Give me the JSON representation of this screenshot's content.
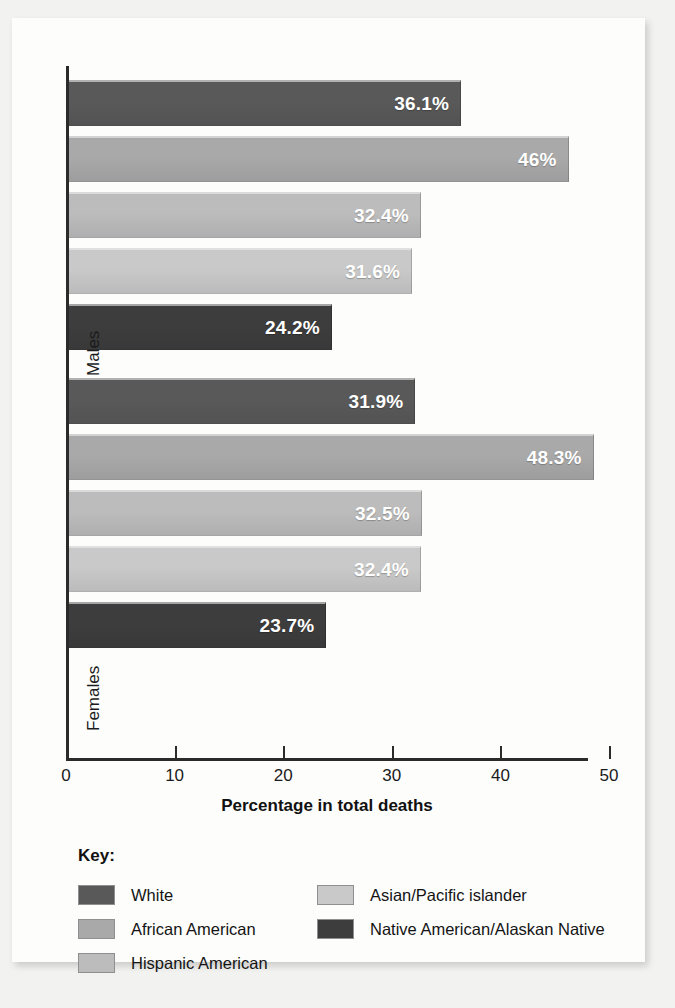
{
  "chart_data": {
    "type": "bar",
    "orientation": "horizontal",
    "title": "",
    "xlabel": "Percentage in total deaths",
    "ylabel": "",
    "xlim": [
      0,
      50
    ],
    "xticks": [
      0,
      10,
      20,
      30,
      40,
      50
    ],
    "xtick_labels": [
      "0",
      "10",
      "20",
      "30",
      "40",
      "50"
    ],
    "grid": false,
    "legend_position": "bottom",
    "legend_title": "Key:",
    "categories": [
      "White",
      "African American",
      "Hispanic American",
      "Asian/Pacific islander",
      "Native American/Alaskan Native"
    ],
    "groups": [
      "Males",
      "Females"
    ],
    "series": [
      {
        "name": "Males",
        "values": [
          36.1,
          46,
          32.4,
          31.6,
          24.2
        ],
        "labels": [
          "36.1%",
          "46%",
          "32.4%",
          "31.6%",
          "24.2%"
        ]
      },
      {
        "name": "Females",
        "values": [
          31.9,
          48.3,
          32.5,
          32.4,
          23.7
        ],
        "labels": [
          "31.9%",
          "48.3%",
          "32.5%",
          "32.4%",
          "23.7%"
        ]
      }
    ],
    "colors": {
      "White": "#595959",
      "African American": "#a9a9a9",
      "Hispanic American": "#bcbcbc",
      "Asian/Pacific islander": "#c9c9c9",
      "Native American/Alaskan Native": "#3d3d3d"
    }
  },
  "axes": {
    "group_males": "Males",
    "group_females": "Females",
    "x_title": "Percentage in total deaths",
    "ticks": [
      {
        "value": "0"
      },
      {
        "value": "10"
      },
      {
        "value": "20"
      },
      {
        "value": "30"
      },
      {
        "value": "40"
      },
      {
        "value": "50"
      }
    ]
  },
  "key": {
    "title": "Key:",
    "left_column": [
      {
        "label": "White",
        "color": "#595959"
      },
      {
        "label": "African American",
        "color": "#a9a9a9"
      },
      {
        "label": "Hispanic American",
        "color": "#bcbcbc"
      }
    ],
    "right_column": [
      {
        "label": "Asian/Pacific islander",
        "color": "#c9c9c9"
      },
      {
        "label": "Native American/Alaskan Native",
        "color": "#3d3d3d"
      }
    ]
  }
}
